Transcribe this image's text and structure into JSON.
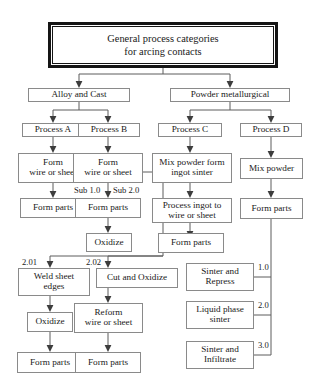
{
  "diagram": {
    "title_box": {
      "line1": "General process categories",
      "line2": "for arcing contacts"
    },
    "branches": {
      "left": "Alloy and Cast",
      "right": "Powder metallurgical"
    },
    "processes": {
      "a": "Process A",
      "b": "Process B",
      "c": "Process C",
      "d": "Process D"
    },
    "nodes": {
      "form_wire_a_l1": "Form",
      "form_wire_a_l2": "wire or sheet",
      "form_wire_b_l1": "Form",
      "form_wire_b_l2": "wire or sheet",
      "mix_powder_form_l1": "Mix powder form",
      "mix_powder_form_l2": "ingot sinter",
      "mix_powder": "Mix powder",
      "form_parts_a": "Form parts",
      "form_parts_b": "Form parts",
      "process_ingot_l1": "Process ingot to",
      "process_ingot_l2": "wire or sheet",
      "form_parts_d": "Form parts",
      "oxidize_b": "Oxidize",
      "form_parts_c": "Form parts",
      "weld_sheet_l1": "Weld sheet",
      "weld_sheet_l2": "edges",
      "cut_and_oxidize": "Cut and Oxidize",
      "sinter_repress_l1": "Sinter and",
      "sinter_repress_l2": "Repress",
      "oxidize_weld": "Oxidize",
      "reform_wire_l1": "Reform",
      "reform_wire_l2": "wire or sheet",
      "liquid_phase_l1": "Liquid phase",
      "liquid_phase_l2": "sinter",
      "form_parts_weld": "Form parts",
      "form_parts_reform": "Form parts",
      "sinter_infiltrate_l1": "Sinter and",
      "sinter_infiltrate_l2": "Infiltrate"
    },
    "edge_labels": {
      "sub_1_0": "Sub 1.0",
      "sub_2_0": "Sub 2.0",
      "two_zero_one": "2.01",
      "two_zero_two": "2.02",
      "one_zero": "1.0",
      "two_zero": "2.0",
      "three_zero": "3.0"
    },
    "colors": {
      "box_border": "#8a8a8a",
      "title_border": "#151515",
      "wire": "#5d5d5d",
      "text": "#1a1a1a",
      "background": "#ffffff"
    }
  }
}
